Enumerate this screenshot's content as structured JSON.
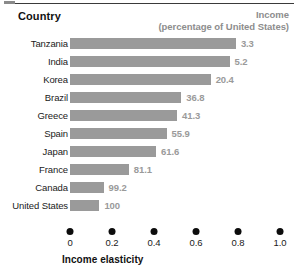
{
  "header": {
    "country_label": "Country",
    "income_label": "Income",
    "income_sublabel": "(percentage of United States)"
  },
  "axis": {
    "title": "Income elasticity",
    "ticks": [
      "0",
      "0.2",
      "0.4",
      "0.6",
      "0.8",
      "1.0"
    ]
  },
  "colors": {
    "bar": "#9a9a9a",
    "value_text": "#9a9a9a",
    "label_text": "#1a1a1a",
    "header_text": "#111111",
    "income_header_text": "#8d8d8d",
    "tick_dot": "#0c0c0c",
    "rule": "#3a3a3a",
    "background": "#ffffff"
  },
  "chart_data": {
    "type": "bar",
    "orientation": "horizontal",
    "title": "",
    "xlabel": "Income elasticity",
    "ylabel": "Country",
    "xlim": [
      0,
      1.0
    ],
    "xticks": [
      0,
      0.2,
      0.4,
      0.6,
      0.8,
      1.0
    ],
    "grid": false,
    "legend": "none",
    "categories": [
      "Tanzania",
      "India",
      "Korea",
      "Brazil",
      "Greece",
      "Spain",
      "Japan",
      "France",
      "Canada",
      "United States"
    ],
    "values": [
      0.79,
      0.76,
      0.67,
      0.53,
      0.51,
      0.46,
      0.41,
      0.28,
      0.16,
      0.14
    ],
    "data_labels": [
      "3.3",
      "5.2",
      "20.4",
      "36.8",
      "41.3",
      "55.9",
      "61.6",
      "81.1",
      "99.2",
      "100"
    ],
    "data_label_meaning": "Income (percentage of United States)",
    "rows": [
      {
        "country": "Tanzania",
        "elasticity": 0.79,
        "income_pct": "3.3"
      },
      {
        "country": "India",
        "elasticity": 0.76,
        "income_pct": "5.2"
      },
      {
        "country": "Korea",
        "elasticity": 0.67,
        "income_pct": "20.4"
      },
      {
        "country": "Brazil",
        "elasticity": 0.53,
        "income_pct": "36.8"
      },
      {
        "country": "Greece",
        "elasticity": 0.51,
        "income_pct": "41.3"
      },
      {
        "country": "Spain",
        "elasticity": 0.46,
        "income_pct": "55.9"
      },
      {
        "country": "Japan",
        "elasticity": 0.41,
        "income_pct": "61.6"
      },
      {
        "country": "France",
        "elasticity": 0.28,
        "income_pct": "81.1"
      },
      {
        "country": "Canada",
        "elasticity": 0.16,
        "income_pct": "99.2"
      },
      {
        "country": "United States",
        "elasticity": 0.14,
        "income_pct": "100"
      }
    ]
  }
}
